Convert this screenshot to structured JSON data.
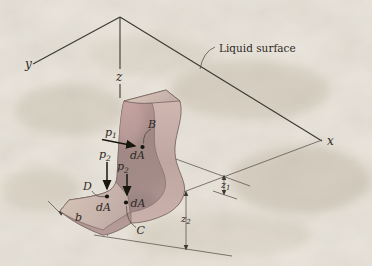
{
  "figure": {
    "liquid_surface_label": "Liquid surface",
    "axes": {
      "x": "x",
      "y": "y",
      "z": "z"
    },
    "points": {
      "B": "B",
      "C": "C",
      "D": "D"
    },
    "area_element_label": "dA",
    "pressures": {
      "p1": {
        "base": "p",
        "sub": "1"
      },
      "p2": {
        "base": "p",
        "sub": "2"
      }
    },
    "dimensions": {
      "b": "b",
      "z1": {
        "base": "z",
        "sub": "1"
      },
      "z2": {
        "base": "z",
        "sub": "2"
      }
    },
    "colors": {
      "background": "#e9e4db",
      "plate-front": "#ac928f",
      "plate-side": "#c7aca7",
      "plate-top": "#d8c6bd",
      "flange-top": "#ccb9b0",
      "line": "#55504a",
      "axis": "#3b3733",
      "teal-label": "#3e8a87",
      "ink": "#2e2a26"
    }
  }
}
